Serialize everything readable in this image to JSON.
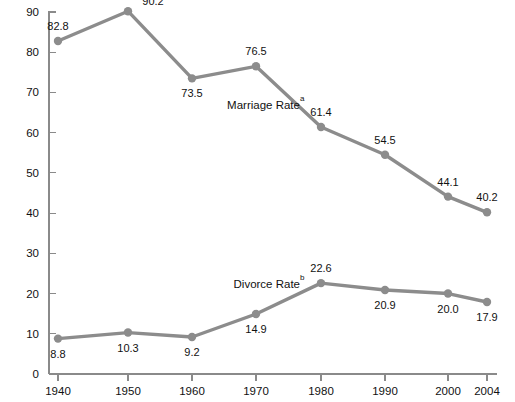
{
  "chart_data": {
    "type": "line",
    "title": "",
    "subtitle": "",
    "xlabel": "",
    "ylabel": "",
    "x": [
      1940,
      1950,
      1960,
      1970,
      1980,
      1990,
      2000,
      2004
    ],
    "categories": [
      "1940",
      "1950",
      "1960",
      "1970",
      "1980",
      "1990",
      "2000",
      "2004"
    ],
    "xlim": [
      1936,
      2008
    ],
    "ylim": [
      0,
      90
    ],
    "y_ticks": [
      0,
      10,
      20,
      30,
      40,
      50,
      60,
      70,
      80,
      90
    ],
    "y_tick_labels": [
      "0",
      "10",
      "20",
      "30",
      "40",
      "50",
      "60",
      "70",
      "80",
      "90"
    ],
    "grid": false,
    "legend_position": "inline-annotation",
    "series": [
      {
        "name": "Marriage Rate",
        "name_superscript": "a",
        "color": "#8c8c8c",
        "marker": "circle",
        "values": [
          82.8,
          90.2,
          73.5,
          76.5,
          61.4,
          54.5,
          44.1,
          40.2
        ],
        "value_labels": [
          "82.8",
          "90.2",
          "73.5",
          "76.5",
          "61.4",
          "54.5",
          "44.1",
          "40.2"
        ],
        "label_positions": [
          "above",
          "right-above",
          "below",
          "above",
          "above",
          "above",
          "above",
          "above"
        ],
        "annotation": {
          "text": "Marriage Rate",
          "superscript": "a",
          "x": 1971.5,
          "y": 66.0
        }
      },
      {
        "name": "Divorce Rate",
        "name_superscript": "b",
        "color": "#8c8c8c",
        "marker": "circle",
        "values": [
          8.8,
          10.3,
          9.2,
          14.9,
          22.6,
          20.9,
          20.0,
          17.9
        ],
        "value_labels": [
          "8.8",
          "10.3",
          "9.2",
          "14.9",
          "22.6",
          "20.9",
          "20.0",
          "17.9"
        ],
        "label_positions": [
          "below",
          "below",
          "below",
          "below",
          "above",
          "below",
          "below",
          "below"
        ],
        "annotation": {
          "text": "Divorce Rate",
          "superscript": "b",
          "x": 1972.0,
          "y": 21.5
        }
      }
    ]
  },
  "axes": {
    "axis_color": "#8a8a8a",
    "y_axis_label_count": 10,
    "x_axis_label_count": 8
  },
  "colors": {
    "background": "#ffffff",
    "series_gray": "#8c8c8c",
    "axis_gray": "#8a8a8a",
    "text": "#111111"
  }
}
